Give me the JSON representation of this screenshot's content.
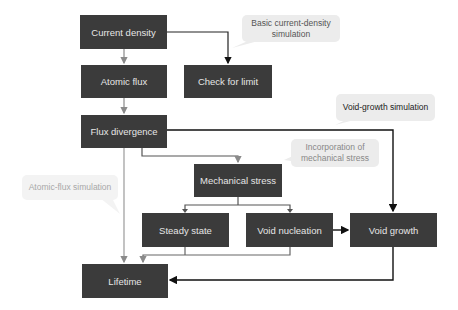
{
  "diagram": {
    "nodes": {
      "current_density": "Current density",
      "atomic_flux": "Atomic flux",
      "check_for_limit": "Check for limit",
      "flux_divergence": "Flux divergence",
      "mechanical_stress": "Mechanical stress",
      "steady_state": "Steady state",
      "void_nucleation": "Void nucleation",
      "void_growth": "Void growth",
      "lifetime": "Lifetime"
    },
    "callouts": {
      "basic_current_density": "Basic current-density simulation",
      "void_growth_simulation": "Void-growth simulation",
      "incorporation_mechanical_stress": "Incorporation of mechanical stress",
      "atomic_flux_simulation": "Atomic-flux simulation"
    },
    "colors": {
      "box": "#3b3b3b",
      "box_text": "#e6e6e6",
      "connector_gray": "#8a8a8a",
      "connector_black": "#111111",
      "callout_bg": "#ececec"
    }
  }
}
